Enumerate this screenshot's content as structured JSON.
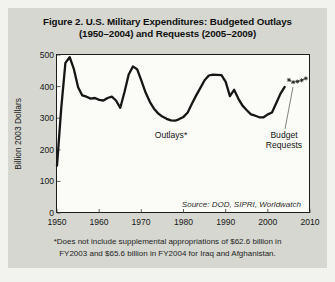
{
  "figure": {
    "title_line1": "Figure 2. U.S. Military Expenditures: Budgeted Outlays",
    "title_line2": "(1950–2004) and Requests (2005–2009)",
    "source": "Source: DOD, SIPRI, Worldwatch",
    "footnote": "*Does not include supplemental appropriations of $62.6 billion in\nFY2003 and $65.6 billion in FY2004 for Iraq and Afghanistan."
  },
  "chart_data": {
    "type": "line",
    "title": "U.S. Military Expenditures: Budgeted Outlays (1950–2004) and Requests (2005–2009)",
    "xlabel": "",
    "ylabel": "Billion 2003 Dollars",
    "xlim": [
      1950,
      2010
    ],
    "ylim": [
      0,
      500
    ],
    "xticks": [
      1950,
      1960,
      1970,
      1980,
      1990,
      2000,
      2010
    ],
    "yticks": [
      0,
      100,
      200,
      300,
      400,
      500
    ],
    "grid": false,
    "annotations": {
      "outlays_label": "Outlays*",
      "requests_label": "Budget\nRequests"
    },
    "series": [
      {
        "name": "Outlays",
        "style": "solid",
        "x": [
          1950,
          1951,
          1952,
          1953,
          1954,
          1955,
          1956,
          1957,
          1958,
          1959,
          1960,
          1961,
          1962,
          1963,
          1964,
          1965,
          1966,
          1967,
          1968,
          1969,
          1970,
          1971,
          1972,
          1973,
          1974,
          1975,
          1976,
          1977,
          1978,
          1979,
          1980,
          1981,
          1982,
          1983,
          1984,
          1985,
          1986,
          1987,
          1988,
          1989,
          1990,
          1991,
          1992,
          1993,
          1994,
          1995,
          1996,
          1997,
          1998,
          1999,
          2000,
          2001,
          2002,
          2003,
          2004
        ],
        "values": [
          150,
          330,
          475,
          493,
          455,
          398,
          372,
          368,
          362,
          364,
          358,
          356,
          364,
          368,
          356,
          333,
          383,
          438,
          464,
          455,
          420,
          382,
          352,
          330,
          315,
          305,
          298,
          293,
          292,
          297,
          304,
          318,
          346,
          372,
          396,
          420,
          435,
          438,
          437,
          436,
          415,
          370,
          390,
          362,
          340,
          325,
          312,
          308,
          303,
          303,
          312,
          318,
          348,
          378,
          399
        ]
      },
      {
        "name": "Budget Requests",
        "style": "dashed-star",
        "x": [
          2005,
          2006,
          2007,
          2008,
          2009
        ],
        "values": [
          421,
          414,
          416,
          420,
          426
        ]
      }
    ],
    "colors": {
      "line": "#161616",
      "panel_bg": "#d5d7d0",
      "plot_bg": "#fbfbf7",
      "page_bg": "#f2f3ee",
      "text": "#141414"
    }
  }
}
